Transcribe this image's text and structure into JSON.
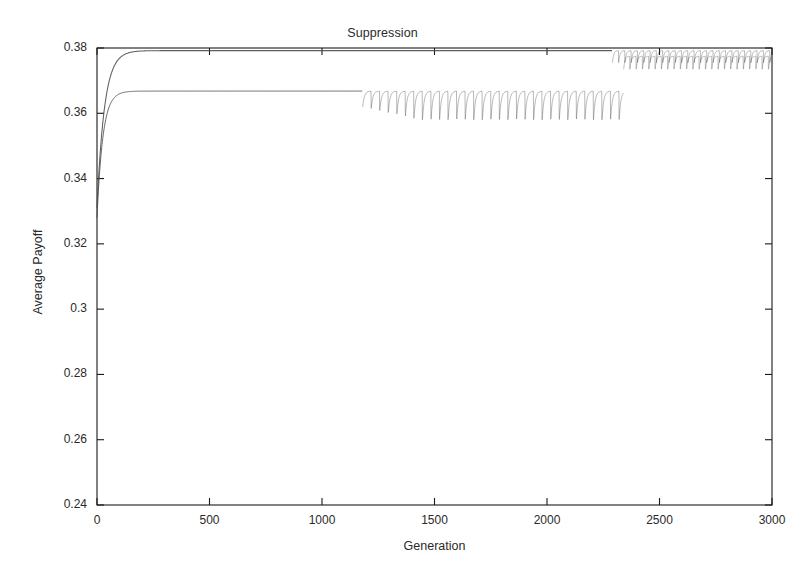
{
  "figure": {
    "background_color": "#ffffff",
    "axis_color": "#1a1a1a",
    "curve_color": "#4d4d4d"
  },
  "chart_data": {
    "type": "line",
    "title": "Suppression",
    "xlabel": "Generation",
    "ylabel": "Average Payoff",
    "xlim": [
      0,
      3000
    ],
    "ylim": [
      0.24,
      0.38
    ],
    "xticks": [
      0,
      500,
      1000,
      1500,
      2000,
      2500,
      3000
    ],
    "xtick_labels": [
      "0",
      "500",
      "1000",
      "1500",
      "2000",
      "2500",
      "3000"
    ],
    "yticks": [
      0.24,
      0.26,
      0.28,
      0.3,
      0.32,
      0.34,
      0.36,
      0.38
    ],
    "ytick_labels": [
      "0.24",
      "0.26",
      "0.28",
      "0.3",
      "0.32",
      "0.34",
      "0.36",
      "0.38"
    ],
    "grid": false,
    "legend": null,
    "tick_direction": "in",
    "series": [
      {
        "name": "upper-run",
        "description": "Rises steeply from ~0.331 at generation 0 to a plateau of ~0.3792 by generation ~200; stays flat until generation ~2290, after which it shows a dense sawtooth of small downward spikes to ~0.3755 that persists to generation 3000.",
        "start_value": 0.331,
        "plateau_value": 0.3792,
        "rise_end_generation": 200,
        "oscillation_start_generation": 2290,
        "oscillation_min": 0.3755,
        "oscillation_period": 28
      },
      {
        "name": "lower-run",
        "description": "Rises steeply from ~0.328 at generation 0 to a plateau of ~0.3668 by generation ~230; flat until generation ~1180, then a sawtooth band of sharp downward spikes to ~0.358 with recovery to ~0.3668; at generation ~2340 the band jumps up to ~0.3775 and merges with the upper run's sawtooth band through generation 3000.",
        "start_value": 0.328,
        "plateau_value": 0.3668,
        "rise_end_generation": 230,
        "oscillation_start_generation": 1180,
        "oscillation_min": 0.358,
        "oscillation_period": 38,
        "jump_generation": 2340,
        "post_jump_plateau": 0.3775,
        "post_jump_min": 0.3735
      }
    ],
    "sample_points": {
      "x": [
        0,
        20,
        40,
        60,
        80,
        100,
        150,
        200,
        300,
        500,
        800,
        1000,
        1180,
        1500,
        2000,
        2290,
        2340,
        2600,
        3000
      ],
      "upper_y": [
        0.331,
        0.3565,
        0.3705,
        0.3762,
        0.3782,
        0.3788,
        0.3791,
        0.3792,
        0.3792,
        0.3792,
        0.3792,
        0.3792,
        0.3792,
        0.3792,
        0.3792,
        0.3792,
        0.3792,
        0.3792,
        0.3792
      ],
      "lower_y": [
        0.328,
        0.3528,
        0.3618,
        0.3652,
        0.3663,
        0.3666,
        0.3667,
        0.3668,
        0.3668,
        0.3668,
        0.3668,
        0.3668,
        0.3668,
        0.3668,
        0.3668,
        0.3668,
        0.3775,
        0.3775,
        0.3775
      ]
    }
  }
}
